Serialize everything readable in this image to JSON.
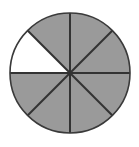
{
  "figure": {
    "background_color": "#ffffff"
  },
  "chart_data": {
    "type": "pie",
    "title": "",
    "subtitle": "",
    "xlabel": "",
    "ylabel": "",
    "legend": [],
    "legend_position": "none",
    "grid": false,
    "total_sectors": 8,
    "sector_angle_degrees": 45,
    "shaded_count": 7,
    "unshaded_count": 1,
    "fraction_shaded": "7/8",
    "fraction_unshaded": "1/8",
    "categories": [
      "sector-1",
      "sector-2",
      "sector-3",
      "sector-4",
      "sector-5",
      "sector-6",
      "sector-7",
      "sector-8"
    ],
    "values": [
      45,
      45,
      45,
      45,
      45,
      45,
      45,
      45
    ],
    "slice_states": [
      "shaded",
      "shaded",
      "shaded",
      "unshaded",
      "shaded",
      "shaded",
      "shaded",
      "shaded"
    ],
    "slice_start_angles_deg": [
      0,
      45,
      90,
      135,
      180,
      225,
      270,
      315
    ],
    "slice_end_angles_deg": [
      45,
      90,
      135,
      180,
      225,
      270,
      315,
      360
    ],
    "slice_colors": [
      "#9a9a9a",
      "#9a9a9a",
      "#9a9a9a",
      "#ffffff",
      "#9a9a9a",
      "#9a9a9a",
      "#9a9a9a",
      "#9a9a9a"
    ],
    "geometry": {
      "center_x": 70,
      "center_y": 73,
      "radius": 60,
      "canvas_width": 139,
      "canvas_height": 147
    }
  },
  "colors": {
    "shaded_fill": "#9a9a9a",
    "unshaded_fill": "#ffffff",
    "outline": "#3a3a3a",
    "divider": "#333333",
    "background": "#ffffff"
  },
  "strokes": {
    "circle_outline_width": "1.6",
    "divider_width": "2"
  },
  "dividers": [
    {
      "name": "vertical-diameter",
      "angle_deg": 90
    },
    {
      "name": "horizontal-diameter",
      "angle_deg": 0
    },
    {
      "name": "diagonal-diameter-45",
      "angle_deg": 45
    },
    {
      "name": "diagonal-diameter-135",
      "angle_deg": 135
    }
  ]
}
